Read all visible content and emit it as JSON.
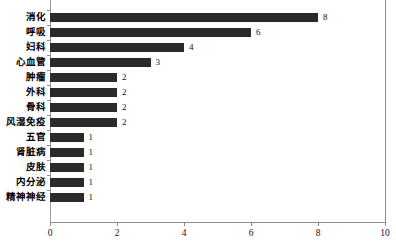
{
  "chart_data": {
    "type": "bar",
    "orientation": "horizontal",
    "title": "",
    "xlabel": "",
    "ylabel": "",
    "categories": [
      "消化",
      "呼吸",
      "妇科",
      "心血管",
      "肿瘤",
      "外科",
      "骨科",
      "风湿免疫",
      "五官",
      "肾脏病",
      "皮肤",
      "内分泌",
      "精神神经"
    ],
    "values": [
      8,
      6,
      4,
      3,
      2,
      2,
      2,
      2,
      1,
      1,
      1,
      1,
      1
    ],
    "data_labels": [
      "8",
      "6",
      "4",
      "3",
      "2",
      "2",
      "2",
      "2",
      "1",
      "1",
      "1",
      "1",
      "1"
    ],
    "xlim": [
      0,
      10
    ],
    "xticks": [
      0,
      2,
      4,
      6,
      8,
      10
    ],
    "xtick_labels": [
      "0",
      "2",
      "4",
      "6",
      "8",
      "10"
    ],
    "grid": false,
    "legend": null,
    "bar_color": "#2a2a2a",
    "axis_color": "#8c8c8c",
    "background_color": "#ffffff"
  }
}
